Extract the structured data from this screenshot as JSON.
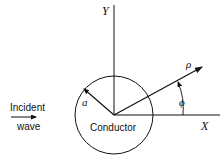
{
  "diagram": {
    "axis_x_label": "X",
    "axis_y_label": "Y",
    "radius_label": "a",
    "rho_label": "ρ",
    "angle_label": "ϕ",
    "object_label": "Conductor",
    "incident_line1": "Incident",
    "incident_line2": "wave"
  }
}
